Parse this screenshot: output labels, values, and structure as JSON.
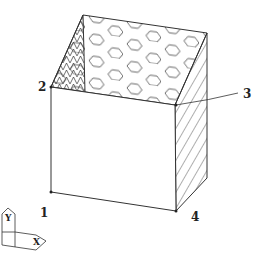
{
  "diagram": {
    "type": "isometric box with patterned faces",
    "vertex_labels": [
      {
        "id": "1",
        "text": "1"
      },
      {
        "id": "2",
        "text": "2"
      },
      {
        "id": "3",
        "text": "3"
      },
      {
        "id": "4",
        "text": "4"
      }
    ],
    "axis_indicator": {
      "x_label": "X",
      "y_label": "Y"
    },
    "faces": {
      "back": "hexagon pattern",
      "left": "cross-hatched",
      "right": "diagonal hatch",
      "front": "plain"
    }
  }
}
